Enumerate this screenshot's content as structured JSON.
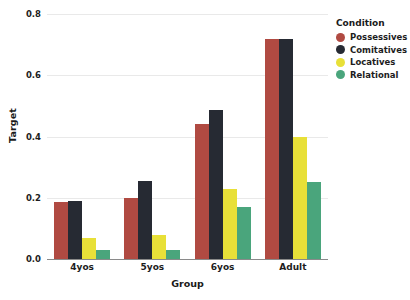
{
  "chart_data": {
    "type": "bar",
    "title": "",
    "xlabel": "Group",
    "ylabel": "Target",
    "categories": [
      "4yos",
      "5yos",
      "6yos",
      "Adult"
    ],
    "ylim": [
      0.0,
      0.8
    ],
    "yticks": [
      "0.0",
      "0.2",
      "0.4",
      "0.6",
      "0.8"
    ],
    "ytick_values": [
      0.0,
      0.2,
      0.4,
      0.6,
      0.8
    ],
    "grid": true,
    "legend_position": "right",
    "legend_title": "Condition",
    "series": [
      {
        "name": "Possessives",
        "color": "#b04a42",
        "values": [
          0.185,
          0.2,
          0.44,
          0.72
        ]
      },
      {
        "name": "Comitatives",
        "color": "#262a33",
        "values": [
          0.19,
          0.255,
          0.485,
          0.72
        ]
      },
      {
        "name": "Locatives",
        "color": "#e8e038",
        "values": [
          0.07,
          0.08,
          0.23,
          0.4
        ]
      },
      {
        "name": "Relational",
        "color": "#4aa57c",
        "values": [
          0.03,
          0.03,
          0.17,
          0.25
        ]
      }
    ]
  }
}
